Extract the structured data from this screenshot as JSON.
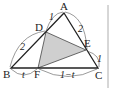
{
  "diagram": {
    "type": "triangle-geometry",
    "points": {
      "A": {
        "label": "A",
        "x": 64,
        "y": 13
      },
      "B": {
        "label": "B",
        "x": 11,
        "y": 68
      },
      "C": {
        "label": "C",
        "x": 98,
        "y": 68
      },
      "D": {
        "label": "D",
        "x": 46,
        "y": 32
      },
      "E": {
        "label": "E",
        "x": 86,
        "y": 50
      },
      "F": {
        "label": "F",
        "x": 38,
        "y": 68
      }
    },
    "segment_labels": {
      "AD": "1",
      "DB": "2",
      "AE": "2",
      "EC": "1",
      "BF": "t",
      "FC": "1−t"
    },
    "shaded_region": "triangle DEF",
    "colors": {
      "stroke": "#222222",
      "shade": "#cfcfcf",
      "arc": "#555555",
      "border": "#999999"
    }
  }
}
